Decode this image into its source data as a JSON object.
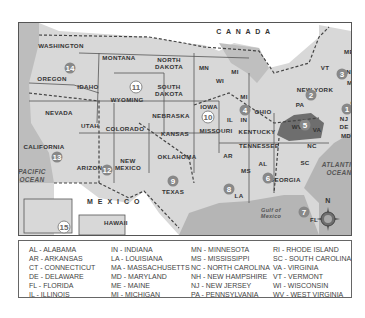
{
  "map": {
    "labels": {
      "canada": "C A N A D A",
      "mexico": "M E X I C O",
      "pacific": "PACIFIC OCEAN",
      "atlantic": "ATLANTIC OCEAN",
      "gulf": "Gulf of Mexico",
      "compass_n": "N"
    },
    "states": [
      {
        "name": "WASHINGTON",
        "x": 42,
        "y": 22
      },
      {
        "name": "OREGON",
        "x": 33,
        "y": 55
      },
      {
        "name": "IDAHO",
        "x": 69,
        "y": 63
      },
      {
        "name": "MONTANA",
        "x": 100,
        "y": 34
      },
      {
        "name": "WYOMING",
        "x": 108,
        "y": 76
      },
      {
        "name": "NORTH DAKOTA",
        "x": 150,
        "y": 40
      },
      {
        "name": "SOUTH DAKOTA",
        "x": 150,
        "y": 67
      },
      {
        "name": "NEBRASKA",
        "x": 152,
        "y": 92
      },
      {
        "name": "NEVADA",
        "x": 40,
        "y": 89
      },
      {
        "name": "UTAH",
        "x": 71,
        "y": 102
      },
      {
        "name": "COLORADO",
        "x": 106,
        "y": 105
      },
      {
        "name": "KANSAS",
        "x": 156,
        "y": 110
      },
      {
        "name": "CALIFORNIA",
        "x": 25,
        "y": 123
      },
      {
        "name": "ARIZONA",
        "x": 73,
        "y": 144
      },
      {
        "name": "NEW MEXICO",
        "x": 109,
        "y": 141
      },
      {
        "name": "OKLAHOMA",
        "x": 158,
        "y": 133
      },
      {
        "name": "TEXAS",
        "x": 154,
        "y": 168
      },
      {
        "name": "MN",
        "x": 185,
        "y": 44
      },
      {
        "name": "WI",
        "x": 201,
        "y": 57
      },
      {
        "name": "MI",
        "x": 216,
        "y": 48
      },
      {
        "name": "IOWA",
        "x": 190,
        "y": 83
      },
      {
        "name": "MI",
        "x": 225,
        "y": 73
      },
      {
        "name": "IL",
        "x": 211,
        "y": 96
      },
      {
        "name": "IN",
        "x": 225,
        "y": 96
      },
      {
        "name": "OHIO",
        "x": 244,
        "y": 88
      },
      {
        "name": "MISSOURI",
        "x": 197,
        "y": 107
      },
      {
        "name": "KENTUCKY",
        "x": 238,
        "y": 108
      },
      {
        "name": "TENNESSEE",
        "x": 240,
        "y": 122
      },
      {
        "name": "AR",
        "x": 209,
        "y": 132
      },
      {
        "name": "MS",
        "x": 227,
        "y": 147
      },
      {
        "name": "AL",
        "x": 244,
        "y": 140
      },
      {
        "name": "GEORGIA",
        "x": 266,
        "y": 156
      },
      {
        "name": "LA",
        "x": 220,
        "y": 172
      },
      {
        "name": "SC",
        "x": 286,
        "y": 139
      },
      {
        "name": "NC",
        "x": 293,
        "y": 122
      },
      {
        "name": "FL",
        "x": 295,
        "y": 196
      },
      {
        "name": "WV",
        "x": 278,
        "y": 103
      },
      {
        "name": "VA",
        "x": 298,
        "y": 106
      },
      {
        "name": "PA",
        "x": 281,
        "y": 81
      },
      {
        "name": "NEW YORK",
        "x": 296,
        "y": 66
      },
      {
        "name": "VT",
        "x": 306,
        "y": 44
      },
      {
        "name": "NH",
        "x": 332,
        "y": 48
      },
      {
        "name": "ME",
        "x": 330,
        "y": 28
      },
      {
        "name": "MA",
        "x": 333,
        "y": 59
      },
      {
        "name": "RI",
        "x": 338,
        "y": 71
      },
      {
        "name": "CT",
        "x": 336,
        "y": 79
      },
      {
        "name": "NJ",
        "x": 325,
        "y": 95
      },
      {
        "name": "DE",
        "x": 325,
        "y": 103
      },
      {
        "name": "MD",
        "x": 327,
        "y": 112
      },
      {
        "name": "ALASKA",
        "x": 42,
        "y": 215
      },
      {
        "name": "HAWAII",
        "x": 97,
        "y": 199
      }
    ],
    "regions": [
      {
        "n": "1",
        "x": 328,
        "y": 86
      },
      {
        "n": "2",
        "x": 292,
        "y": 72
      },
      {
        "n": "3",
        "x": 323,
        "y": 51
      },
      {
        "n": "4",
        "x": 226,
        "y": 87
      },
      {
        "n": "5",
        "x": 286,
        "y": 102
      },
      {
        "n": "6",
        "x": 249,
        "y": 155
      },
      {
        "n": "7",
        "x": 285,
        "y": 189
      },
      {
        "n": "8",
        "x": 210,
        "y": 166
      },
      {
        "n": "9",
        "x": 154,
        "y": 158
      },
      {
        "n": "10",
        "x": 189,
        "y": 94
      },
      {
        "n": "11",
        "x": 117,
        "y": 64
      },
      {
        "n": "12",
        "x": 88,
        "y": 147
      },
      {
        "n": "13",
        "x": 38,
        "y": 134
      },
      {
        "n": "14",
        "x": 51,
        "y": 45
      },
      {
        "n": "15",
        "x": 45,
        "y": 204
      },
      {
        "n": "16",
        "x": 93,
        "y": 222
      }
    ]
  },
  "legend": {
    "columns": [
      [
        "AL - ALABAMA",
        "AR - ARKANSAS",
        "CT - CONNECTICUT",
        "DE - DELAWARE",
        "FL - FLORIDA",
        "IL - ILLINOIS"
      ],
      [
        "IN - INDIANA",
        "LA - LOUISIANA",
        "MA - MASSACHUSETTS",
        "MD - MARYLAND",
        "ME - MAINE",
        "MI - MICHIGAN"
      ],
      [
        "MN - MINNESOTA",
        "MS - MISSISSIPPI",
        "NC - NORTH CAROLINA",
        "NH - NEW HAMPSHIRE",
        "NJ - NEW JERSEY",
        "PA - PENNSYLVANIA"
      ],
      [
        "RI - RHODE ISLAND",
        "SC - SOUTH CAROLINA",
        "VA - VIRGINIA",
        "VT - VERMONT",
        "WI - WISCONSIN",
        "WV - WEST VIRGINIA"
      ]
    ]
  }
}
